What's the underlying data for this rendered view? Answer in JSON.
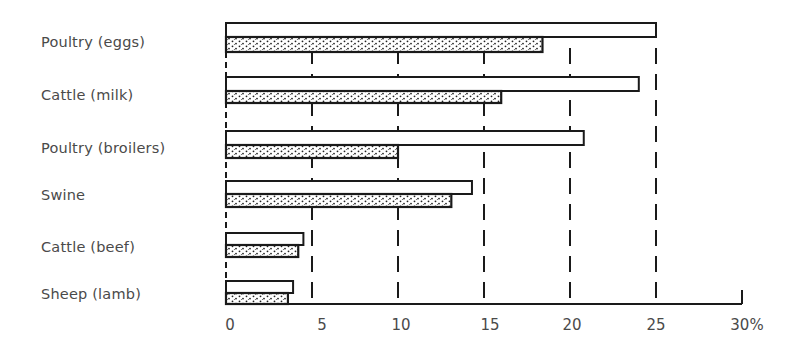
{
  "chart_data": {
    "type": "bar",
    "orientation": "horizontal",
    "title": "",
    "xlabel": "",
    "ylabel": "",
    "xlim": [
      0,
      30
    ],
    "x_unit": "%",
    "tick_labels": [
      "0",
      "5",
      "10",
      "15",
      "20",
      "25",
      "30%"
    ],
    "tick_values": [
      0,
      5,
      10,
      15,
      20,
      25,
      30
    ],
    "grid": "vertical dashed lines at 5, 10, 15, 20, 25",
    "legend": "none shown",
    "categories": [
      "Poultry (eggs)",
      "Cattle (milk)",
      "Poultry (broilers)",
      "Swine",
      "Cattle (beef)",
      "Sheep (lamb)"
    ],
    "series": [
      {
        "name": "Series A (open bars)",
        "style": "white fill, black outline",
        "values": [
          25,
          24,
          20.8,
          14.3,
          4.5,
          3.9
        ]
      },
      {
        "name": "Series B (stippled bars)",
        "style": "dotted fill, black outline",
        "values": [
          18.4,
          16,
          10,
          13.1,
          4.2,
          3.6
        ]
      }
    ]
  },
  "labels": {
    "cat0": "Poultry (eggs)",
    "cat1": "Cattle (milk)",
    "cat2": "Poultry (broilers)",
    "cat3": "Swine",
    "cat4": "Cattle (beef)",
    "cat5": "Sheep (lamb)"
  },
  "ticks": {
    "t0": "0",
    "t5": "5",
    "t10": "10",
    "t15": "15",
    "t20": "20",
    "t25": "25",
    "t30": "30%"
  },
  "colors": {
    "ink": "#1a1a1a",
    "text": "#4a4a4a",
    "background": "#ffffff"
  }
}
